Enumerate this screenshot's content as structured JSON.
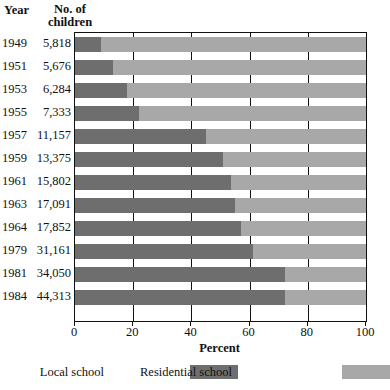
{
  "table_headers": {
    "year": "Year",
    "number_line1": "No. of",
    "number_line2": "children"
  },
  "colors": {
    "local_school": "#6e6e6e",
    "residential_school": "#a8a8a8",
    "axis": "#111111",
    "background": "#ffffff"
  },
  "legend": {
    "position": "bottom",
    "items": [
      {
        "label": "Local school",
        "color": "#6e6e6e"
      },
      {
        "label": "Residential school",
        "color": "#a8a8a8"
      }
    ]
  },
  "rows": [
    {
      "year": "1949",
      "children": "5,818",
      "local": 9,
      "residential": 91
    },
    {
      "year": "1951",
      "children": "5,676",
      "local": 13,
      "residential": 87
    },
    {
      "year": "1953",
      "children": "6,284",
      "local": 18,
      "residential": 82
    },
    {
      "year": "1955",
      "children": "7,333",
      "local": 22,
      "residential": 78
    },
    {
      "year": "1957",
      "children": "11,157",
      "local": 45,
      "residential": 55
    },
    {
      "year": "1959",
      "children": "13,375",
      "local": 51,
      "residential": 49
    },
    {
      "year": "1961",
      "children": "15,802",
      "local": 53.5,
      "residential": 46.5
    },
    {
      "year": "1963",
      "children": "17,091",
      "local": 55,
      "residential": 45
    },
    {
      "year": "1964",
      "children": "17,852",
      "local": 57,
      "residential": 43
    },
    {
      "year": "1979",
      "children": "31,161",
      "local": 61,
      "residential": 39
    },
    {
      "year": "1981",
      "children": "34,050",
      "local": 72,
      "residential": 28
    },
    {
      "year": "1984",
      "children": "44,313",
      "local": 72,
      "residential": 28
    }
  ],
  "chart_data": {
    "type": "bar",
    "orientation": "horizontal",
    "stacked": true,
    "title": "",
    "xlabel": "Percent",
    "ylabel": "",
    "xlim": [
      0,
      100
    ],
    "xticks": [
      0,
      20,
      40,
      60,
      80,
      100
    ],
    "xticklabels": [
      "0",
      "20",
      "40",
      "60",
      "80",
      "100"
    ],
    "grid": true,
    "legend_position": "bottom",
    "categories": [
      "1949",
      "1951",
      "1953",
      "1955",
      "1957",
      "1959",
      "1961",
      "1963",
      "1964",
      "1979",
      "1981",
      "1984"
    ],
    "series": [
      {
        "name": "Local school",
        "color": "#6e6e6e",
        "values": [
          9,
          13,
          18,
          22,
          45,
          51,
          53.5,
          55,
          57,
          61,
          72,
          72
        ]
      },
      {
        "name": "Residential school",
        "color": "#a8a8a8",
        "values": [
          91,
          87,
          82,
          78,
          55,
          49,
          46.5,
          45,
          43,
          39,
          28,
          28
        ]
      }
    ],
    "annotations": {
      "row_table": {
        "headers": [
          "Year",
          "No. of children"
        ],
        "values": [
          "5,818",
          "5,676",
          "6,284",
          "7,333",
          "11,157",
          "13,375",
          "15,802",
          "17,091",
          "17,852",
          "31,161",
          "34,050",
          "44,313"
        ]
      }
    }
  }
}
